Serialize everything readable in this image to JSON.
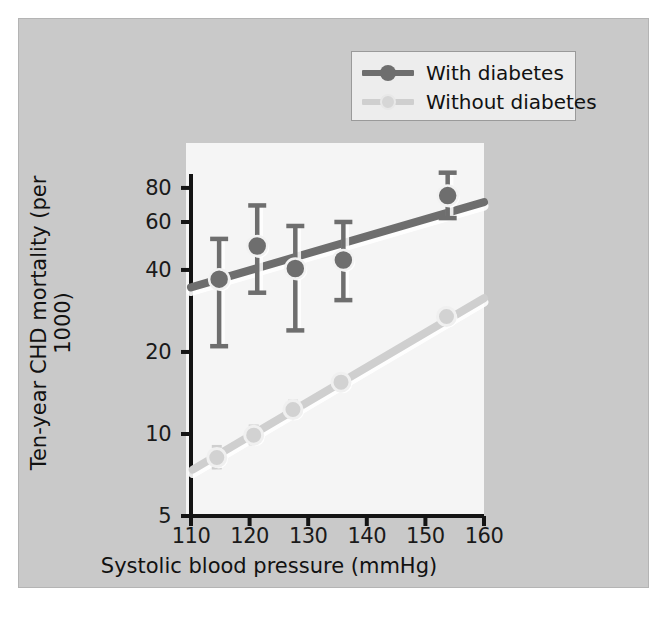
{
  "chart_data": {
    "type": "scatter",
    "title": "",
    "xlabel": "Systolic blood pressure (mmHg)",
    "ylabel": "Ten-year CHD mortality (per 1000)",
    "xlim": [
      110,
      160
    ],
    "ylim": [
      5,
      90
    ],
    "yscale": "log",
    "xticks": [
      110,
      120,
      130,
      140,
      150,
      160
    ],
    "xticklabels": [
      "110",
      "120",
      "130",
      "140",
      "150",
      "160"
    ],
    "yticks": [
      5,
      10,
      20,
      40,
      60,
      80
    ],
    "yticklabels": [
      "5",
      "10",
      "20",
      "40",
      "60",
      "80"
    ],
    "grid": false,
    "legend_position": "top-right",
    "series": [
      {
        "name": "With diabetes",
        "color": "#6e6e6e",
        "marker": "filled-circle",
        "points": [
          {
            "x": 114.8,
            "y": 37,
            "yerr_low": 21,
            "yerr_high": 52
          },
          {
            "x": 121.3,
            "y": 49,
            "yerr_low": 33,
            "yerr_high": 69
          },
          {
            "x": 127.8,
            "y": 40.5,
            "yerr_low": 24,
            "yerr_high": 58
          },
          {
            "x": 136.0,
            "y": 43.5,
            "yerr_low": 31,
            "yerr_high": 60
          },
          {
            "x": 153.8,
            "y": 75,
            "yerr_low": 62,
            "yerr_high": 91
          }
        ],
        "trendline": {
          "x0": 110,
          "y0": 34.5,
          "x1": 160,
          "y1": 71
        }
      },
      {
        "name": "Without diabetes",
        "color": "#cfcfcf",
        "marker": "open-circle",
        "points": [
          {
            "x": 114.4,
            "y": 8.2,
            "yerr_low": 7.5,
            "yerr_high": 9.0
          },
          {
            "x": 120.7,
            "y": 9.9,
            "yerr_low": 9.2,
            "yerr_high": 10.7
          },
          {
            "x": 127.4,
            "y": 12.3,
            "yerr_low": 11.5,
            "yerr_high": 13.2
          },
          {
            "x": 135.6,
            "y": 15.5,
            "yerr_low": 14.6,
            "yerr_high": 16.5
          },
          {
            "x": 153.6,
            "y": 27.0,
            "yerr_low": 25.5,
            "yerr_high": 28.5
          }
        ],
        "trendline": {
          "x0": 110.3,
          "y0": 7.4,
          "x1": 160,
          "y1": 31.5
        }
      }
    ]
  },
  "legend": {
    "entries": [
      {
        "label": "With diabetes"
      },
      {
        "label": "Without diabetes"
      }
    ]
  },
  "colors": {
    "figure_background": "#c9c9c9",
    "panel_background": "#f5f5f5",
    "axis": "#141414",
    "series_with_diabetes": "#6e6e6e",
    "series_without_diabetes": "#cfcfcf",
    "legend_background": "#ededed"
  }
}
